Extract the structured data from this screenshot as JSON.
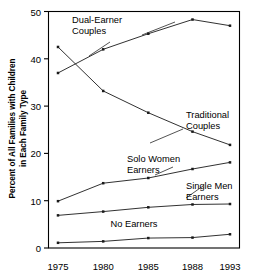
{
  "chart_data": {
    "type": "line",
    "title": "",
    "xlabel": "",
    "ylabel": "Percent of All Families with Children in Each Family Type",
    "ylabel_line1": "Percent of All Families with Children",
    "ylabel_line2": "in Each Family Type",
    "categories": [
      "1975",
      "1980",
      "1985",
      "1988",
      "1993"
    ],
    "x": [
      1975,
      1980,
      1985,
      1988,
      1993
    ],
    "xlim": [
      1975,
      1993
    ],
    "ylim": [
      0,
      50
    ],
    "yticks": [
      0,
      10,
      20,
      30,
      40,
      50
    ],
    "ytick_labels": [
      "0",
      "10",
      "20",
      "30",
      "40",
      "50"
    ],
    "xtick_labels": [
      "1975",
      "1980",
      "1985",
      "1988",
      "1993"
    ],
    "grid": false,
    "legend_position": "inline-annotations",
    "series": [
      {
        "name": "Dual-Earner Couples",
        "values": [
          37.0,
          42.0,
          45.3,
          48.3,
          47.0
        ]
      },
      {
        "name": "Traditional Couples",
        "values": [
          42.5,
          33.2,
          28.6,
          24.6,
          21.8
        ]
      },
      {
        "name": "Solo Women Earners",
        "values": [
          9.9,
          13.7,
          14.8,
          16.7,
          18.1
        ]
      },
      {
        "name": "Single Men Earners",
        "values": [
          6.9,
          7.7,
          8.6,
          9.2,
          9.3
        ]
      },
      {
        "name": "No Earners",
        "values": [
          1.1,
          1.4,
          2.1,
          2.2,
          2.9
        ]
      }
    ],
    "annotations": [
      {
        "name": "Dual-Earner Couples",
        "text_line1": "Dual-Earner",
        "text_line2": "Couples"
      },
      {
        "name": "Traditional Couples",
        "text_line1": "Traditional",
        "text_line2": "Couples"
      },
      {
        "name": "Solo Women Earners",
        "text_line1": "Solo Women",
        "text_line2": "Earners"
      },
      {
        "name": "Single Men Earners",
        "text_line1": "Single Men",
        "text_line2": "Earners"
      },
      {
        "name": "No Earners",
        "text_line1": "No Earners",
        "text_line2": ""
      }
    ],
    "colors": {
      "line": "#1a1a1a",
      "axis": "#000000",
      "background": "#ffffff"
    }
  }
}
